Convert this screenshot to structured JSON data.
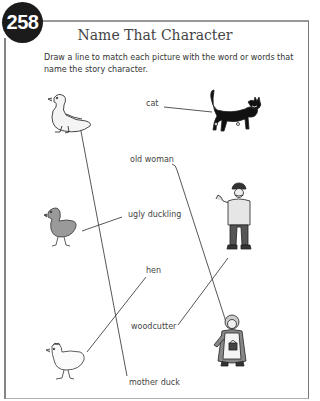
{
  "page": {
    "number": "258",
    "title": "Name That Character",
    "instructions": "Draw a line to match each picture with the word or words that name the story character."
  },
  "words": [
    {
      "id": "cat",
      "label": "cat"
    },
    {
      "id": "old-woman",
      "label": "old woman"
    },
    {
      "id": "ugly-duckling",
      "label": "ugly duckling"
    },
    {
      "id": "hen",
      "label": "hen"
    },
    {
      "id": "woodcutter",
      "label": "woodcutter"
    },
    {
      "id": "mother-duck",
      "label": "mother duck"
    }
  ],
  "pictures": [
    {
      "id": "mother-duck-picture",
      "depicts": "white duck"
    },
    {
      "id": "cat-picture",
      "depicts": "black cat"
    },
    {
      "id": "ugly-duckling-picture",
      "depicts": "gray duckling"
    },
    {
      "id": "woodcutter-picture",
      "depicts": "woodcutter man waving"
    },
    {
      "id": "hen-picture",
      "depicts": "white hen"
    },
    {
      "id": "old-woman-picture",
      "depicts": "old woman with basket"
    }
  ],
  "matches": [
    {
      "word": "cat",
      "picture": "cat-picture"
    },
    {
      "word": "mother duck",
      "picture": "mother-duck-picture"
    },
    {
      "word": "ugly duckling",
      "picture": "ugly-duckling-picture"
    },
    {
      "word": "old woman",
      "picture": "old-woman-picture"
    },
    {
      "word": "woodcutter",
      "picture": "woodcutter-picture"
    },
    {
      "word": "hen",
      "picture": "hen-picture"
    }
  ],
  "colors": {
    "badge": "#1b1b1b",
    "border": "#333333",
    "line": "#444444"
  }
}
